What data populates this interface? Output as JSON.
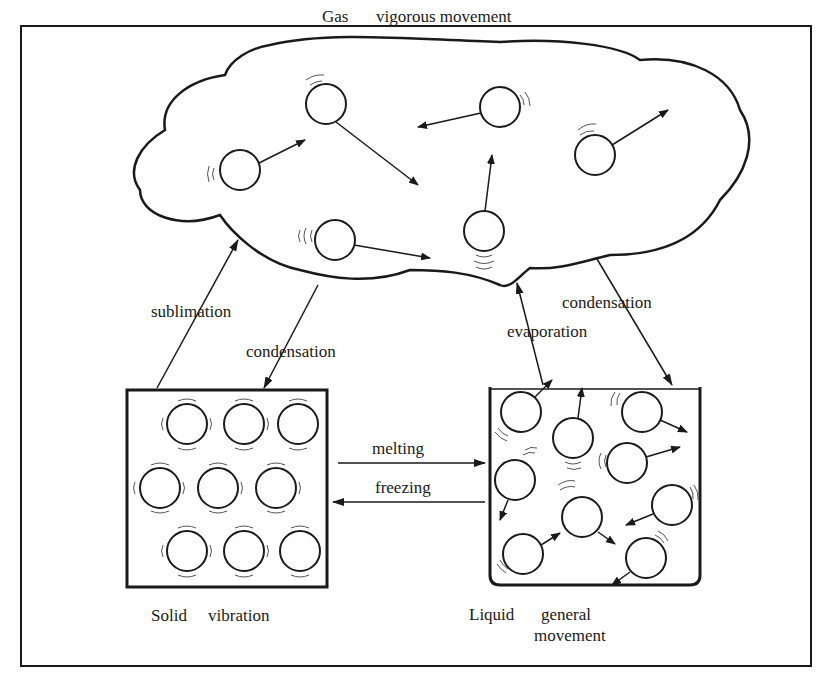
{
  "diagram": {
    "gas_title": "Gas",
    "gas_desc": "vigorous movement",
    "solid_title": "Solid",
    "solid_desc": "vibration",
    "liquid_title": "Liquid",
    "liquid_desc_line1": "general",
    "liquid_desc_line2": "movement",
    "transitions": {
      "sublimation": "sublimation",
      "condensation_solid": "condensation",
      "evaporation": "evaporation",
      "condensation_liquid": "condensation",
      "melting": "melting",
      "freezing": "freezing"
    },
    "colors": {
      "ink": "#1a1a1a",
      "background": "#ffffff"
    }
  }
}
